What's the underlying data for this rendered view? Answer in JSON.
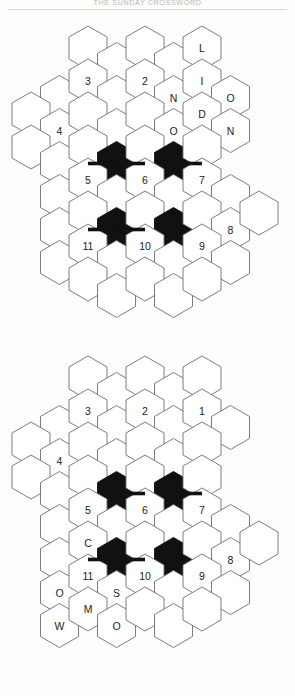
{
  "header": {
    "title": "THE SUNDAY CROSSWORD"
  },
  "colors": {
    "page_background": "#fdfdfb",
    "hex_fill": "#ffffff",
    "hex_stroke": "#6d6d6d",
    "filled_hex": "#111111",
    "label_text": "#1c1c1c",
    "rule": "#d8d8d3"
  },
  "geometry": {
    "hex_width": 38,
    "hex_height": 44,
    "col_step": 28.5,
    "row_step": 33,
    "stroke_width": 0.9,
    "bridge_width": 3.6
  },
  "puzzles": [
    {
      "name": "grid-top",
      "origin_x": 12,
      "origin_y": 26,
      "cells": [
        {
          "col": 2,
          "row": 0,
          "label": "",
          "filled": false
        },
        {
          "col": 3,
          "row": 0,
          "label": "",
          "filled": false
        },
        {
          "col": 4,
          "row": 0,
          "label": "",
          "filled": false
        },
        {
          "col": 5,
          "row": 0,
          "label": "",
          "filled": false
        },
        {
          "col": 6,
          "row": 0,
          "label": "L",
          "filled": false
        },
        {
          "col": 1,
          "row": 1,
          "label": "",
          "filled": false
        },
        {
          "col": 2,
          "row": 1,
          "label": "3",
          "filled": false
        },
        {
          "col": 3,
          "row": 1,
          "label": "",
          "filled": false
        },
        {
          "col": 4,
          "row": 1,
          "label": "2",
          "filled": false
        },
        {
          "col": 5,
          "row": 1,
          "label": "N",
          "filled": false
        },
        {
          "col": 6,
          "row": 1,
          "label": "I",
          "filled": false
        },
        {
          "col": 7,
          "row": 1,
          "label": "O",
          "filled": false
        },
        {
          "col": 0,
          "row": 2,
          "label": "",
          "filled": false
        },
        {
          "col": 1,
          "row": 2,
          "label": "4",
          "filled": false
        },
        {
          "col": 2,
          "row": 2,
          "label": "",
          "filled": false
        },
        {
          "col": 3,
          "row": 2,
          "label": "",
          "filled": false
        },
        {
          "col": 4,
          "row": 2,
          "label": "",
          "filled": false
        },
        {
          "col": 5,
          "row": 2,
          "label": "O",
          "filled": false
        },
        {
          "col": 6,
          "row": 2,
          "label": "D",
          "filled": false
        },
        {
          "col": 7,
          "row": 2,
          "label": "N",
          "filled": false
        },
        {
          "col": 0,
          "row": 3,
          "label": "",
          "filled": false
        },
        {
          "col": 1,
          "row": 3,
          "label": "",
          "filled": false
        },
        {
          "col": 2,
          "row": 3,
          "label": "",
          "filled": false
        },
        {
          "col": 3,
          "row": 3,
          "label": "",
          "filled": true
        },
        {
          "col": 4,
          "row": 3,
          "label": "",
          "filled": false
        },
        {
          "col": 5,
          "row": 3,
          "label": "",
          "filled": true
        },
        {
          "col": 6,
          "row": 3,
          "label": "",
          "filled": false
        },
        {
          "col": 1,
          "row": 4,
          "label": "",
          "filled": false
        },
        {
          "col": 2,
          "row": 4,
          "label": "5",
          "filled": false
        },
        {
          "col": 3,
          "row": 4,
          "label": "",
          "filled": false
        },
        {
          "col": 4,
          "row": 4,
          "label": "6",
          "filled": false
        },
        {
          "col": 5,
          "row": 4,
          "label": "",
          "filled": false
        },
        {
          "col": 6,
          "row": 4,
          "label": "7",
          "filled": false
        },
        {
          "col": 7,
          "row": 4,
          "label": "",
          "filled": false
        },
        {
          "col": 1,
          "row": 5,
          "label": "",
          "filled": false
        },
        {
          "col": 2,
          "row": 5,
          "label": "",
          "filled": false
        },
        {
          "col": 3,
          "row": 5,
          "label": "",
          "filled": true
        },
        {
          "col": 4,
          "row": 5,
          "label": "",
          "filled": false
        },
        {
          "col": 5,
          "row": 5,
          "label": "",
          "filled": true
        },
        {
          "col": 6,
          "row": 5,
          "label": "",
          "filled": false
        },
        {
          "col": 7,
          "row": 5,
          "label": "8",
          "filled": false
        },
        {
          "col": 8,
          "row": 5,
          "label": "",
          "filled": false
        },
        {
          "col": 1,
          "row": 6,
          "label": "",
          "filled": false
        },
        {
          "col": 2,
          "row": 6,
          "label": "11",
          "filled": false
        },
        {
          "col": 3,
          "row": 6,
          "label": "",
          "filled": false
        },
        {
          "col": 4,
          "row": 6,
          "label": "10",
          "filled": false
        },
        {
          "col": 5,
          "row": 6,
          "label": "",
          "filled": false
        },
        {
          "col": 6,
          "row": 6,
          "label": "9",
          "filled": false
        },
        {
          "col": 7,
          "row": 6,
          "label": "",
          "filled": false
        },
        {
          "col": 2,
          "row": 7,
          "label": "",
          "filled": false
        },
        {
          "col": 3,
          "row": 7,
          "label": "",
          "filled": false
        },
        {
          "col": 4,
          "row": 7,
          "label": "",
          "filled": false
        },
        {
          "col": 5,
          "row": 7,
          "label": "",
          "filled": false
        },
        {
          "col": 6,
          "row": 7,
          "label": "",
          "filled": false
        }
      ],
      "bridges": [
        {
          "col": 3,
          "row": 3,
          "dir": "right"
        },
        {
          "col": 5,
          "row": 3,
          "dir": "right"
        },
        {
          "col": 3,
          "row": 3,
          "dir": "left"
        },
        {
          "col": 3,
          "row": 5,
          "dir": "right"
        },
        {
          "col": 3,
          "row": 5,
          "dir": "left"
        }
      ]
    },
    {
      "name": "grid-bottom",
      "origin_x": 12,
      "origin_y": 356,
      "cells": [
        {
          "col": 2,
          "row": 0,
          "label": "",
          "filled": false
        },
        {
          "col": 3,
          "row": 0,
          "label": "",
          "filled": false
        },
        {
          "col": 4,
          "row": 0,
          "label": "",
          "filled": false
        },
        {
          "col": 5,
          "row": 0,
          "label": "",
          "filled": false
        },
        {
          "col": 6,
          "row": 0,
          "label": "",
          "filled": false
        },
        {
          "col": 1,
          "row": 1,
          "label": "",
          "filled": false
        },
        {
          "col": 2,
          "row": 1,
          "label": "3",
          "filled": false
        },
        {
          "col": 3,
          "row": 1,
          "label": "",
          "filled": false
        },
        {
          "col": 4,
          "row": 1,
          "label": "2",
          "filled": false
        },
        {
          "col": 5,
          "row": 1,
          "label": "",
          "filled": false
        },
        {
          "col": 6,
          "row": 1,
          "label": "1",
          "filled": false
        },
        {
          "col": 7,
          "row": 1,
          "label": "",
          "filled": false
        },
        {
          "col": 0,
          "row": 2,
          "label": "",
          "filled": false
        },
        {
          "col": 1,
          "row": 2,
          "label": "4",
          "filled": false
        },
        {
          "col": 2,
          "row": 2,
          "label": "",
          "filled": false
        },
        {
          "col": 3,
          "row": 2,
          "label": "",
          "filled": false
        },
        {
          "col": 4,
          "row": 2,
          "label": "",
          "filled": false
        },
        {
          "col": 5,
          "row": 2,
          "label": "",
          "filled": false
        },
        {
          "col": 6,
          "row": 2,
          "label": "",
          "filled": false
        },
        {
          "col": 0,
          "row": 3,
          "label": "",
          "filled": false
        },
        {
          "col": 1,
          "row": 3,
          "label": "",
          "filled": false
        },
        {
          "col": 2,
          "row": 3,
          "label": "",
          "filled": false
        },
        {
          "col": 3,
          "row": 3,
          "label": "",
          "filled": true
        },
        {
          "col": 4,
          "row": 3,
          "label": "",
          "filled": false
        },
        {
          "col": 5,
          "row": 3,
          "label": "",
          "filled": true
        },
        {
          "col": 6,
          "row": 3,
          "label": "",
          "filled": false
        },
        {
          "col": 1,
          "row": 4,
          "label": "",
          "filled": false
        },
        {
          "col": 2,
          "row": 4,
          "label": "5",
          "filled": false
        },
        {
          "col": 3,
          "row": 4,
          "label": "",
          "filled": false
        },
        {
          "col": 4,
          "row": 4,
          "label": "6",
          "filled": false
        },
        {
          "col": 5,
          "row": 4,
          "label": "",
          "filled": false
        },
        {
          "col": 6,
          "row": 4,
          "label": "7",
          "filled": false
        },
        {
          "col": 7,
          "row": 4,
          "label": "",
          "filled": false
        },
        {
          "col": 1,
          "row": 5,
          "label": "",
          "filled": false
        },
        {
          "col": 2,
          "row": 5,
          "label": "C",
          "filled": false
        },
        {
          "col": 3,
          "row": 5,
          "label": "",
          "filled": true
        },
        {
          "col": 4,
          "row": 5,
          "label": "",
          "filled": false
        },
        {
          "col": 5,
          "row": 5,
          "label": "",
          "filled": true
        },
        {
          "col": 6,
          "row": 5,
          "label": "",
          "filled": false
        },
        {
          "col": 7,
          "row": 5,
          "label": "8",
          "filled": false
        },
        {
          "col": 8,
          "row": 5,
          "label": "",
          "filled": false
        },
        {
          "col": 1,
          "row": 6,
          "label": "O",
          "filled": false
        },
        {
          "col": 2,
          "row": 6,
          "label": "11",
          "filled": false
        },
        {
          "col": 3,
          "row": 6,
          "label": "S",
          "filled": false
        },
        {
          "col": 4,
          "row": 6,
          "label": "10",
          "filled": false
        },
        {
          "col": 5,
          "row": 6,
          "label": "",
          "filled": false
        },
        {
          "col": 6,
          "row": 6,
          "label": "9",
          "filled": false
        },
        {
          "col": 7,
          "row": 6,
          "label": "",
          "filled": false
        },
        {
          "col": 1,
          "row": 7,
          "label": "W",
          "filled": false
        },
        {
          "col": 2,
          "row": 7,
          "label": "M",
          "filled": false
        },
        {
          "col": 3,
          "row": 7,
          "label": "O",
          "filled": false
        },
        {
          "col": 4,
          "row": 7,
          "label": "",
          "filled": false
        },
        {
          "col": 5,
          "row": 7,
          "label": "",
          "filled": false
        },
        {
          "col": 6,
          "row": 7,
          "label": "",
          "filled": false
        }
      ],
      "bridges": [
        {
          "col": 3,
          "row": 3,
          "dir": "right"
        },
        {
          "col": 5,
          "row": 3,
          "dir": "right"
        },
        {
          "col": 3,
          "row": 5,
          "dir": "right"
        },
        {
          "col": 3,
          "row": 5,
          "dir": "left"
        }
      ]
    }
  ]
}
